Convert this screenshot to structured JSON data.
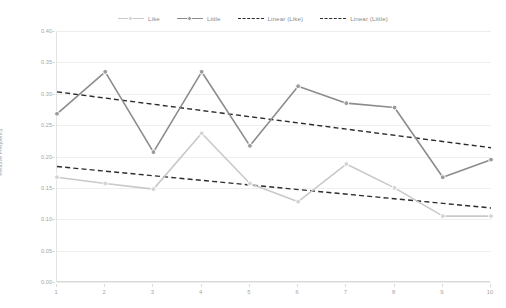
{
  "legend": {
    "position": "top-center",
    "items": [
      {
        "label": "Like",
        "style": "line-marker",
        "color": "#c9c9c9"
      },
      {
        "label": "Little",
        "style": "line-marker",
        "color": "#8c8c8c"
      },
      {
        "label": "Linear (Like)",
        "style": "dashed",
        "color": "#2c2c2c"
      },
      {
        "label": "Linear (Little)",
        "style": "dashed",
        "color": "#2c2c2c"
      }
    ]
  },
  "axes": {
    "y": {
      "label": "Relative Frequency",
      "ticks": [
        "0.40",
        "0.35",
        "0.30",
        "0.25",
        "0.20",
        "0.15",
        "0.10",
        "0.05",
        "0.00"
      ],
      "min": 0.0,
      "max": 0.4
    },
    "x": {
      "label": "",
      "ticks": [
        "1",
        "2",
        "3",
        "4",
        "5",
        "6",
        "7",
        "8",
        "9",
        "10"
      ],
      "min": 1,
      "max": 10
    }
  },
  "chart_data": {
    "type": "line",
    "title": "",
    "subtitle": "",
    "xlabel": "",
    "ylabel": "Relative Frequency",
    "x": [
      1,
      2,
      3,
      4,
      5,
      6,
      7,
      8,
      9,
      10
    ],
    "categories": [
      "1",
      "2",
      "3",
      "4",
      "5",
      "6",
      "7",
      "8",
      "9",
      "10"
    ],
    "xlim": [
      1,
      10
    ],
    "ylim": [
      0.0,
      0.4
    ],
    "grid": true,
    "legend_position": "top-center",
    "series": [
      {
        "name": "Like",
        "kind": "line-marker",
        "color": "#c9c9c9",
        "values": [
          0.167,
          0.157,
          0.148,
          0.237,
          0.157,
          0.128,
          0.188,
          0.15,
          0.105,
          0.105
        ]
      },
      {
        "name": "Little",
        "kind": "line-marker",
        "color": "#8c8c8c",
        "values": [
          0.268,
          0.335,
          0.207,
          0.335,
          0.217,
          0.312,
          0.285,
          0.278,
          0.167,
          0.195
        ]
      },
      {
        "name": "Linear (Like)",
        "kind": "trendline-dashed",
        "color": "#2c2c2c",
        "endpoints": {
          "x1": 1,
          "y1": 0.184,
          "x2": 10,
          "y2": 0.118
        }
      },
      {
        "name": "Linear (Little)",
        "kind": "trendline-dashed",
        "color": "#2c2c2c",
        "endpoints": {
          "x1": 1,
          "y1": 0.303,
          "x2": 10,
          "y2": 0.214
        }
      }
    ]
  },
  "colors": {
    "series_like": "#c9c9c9",
    "series_little": "#8c8c8c",
    "trendline": "#2c2c2c",
    "gridline": "#efefef",
    "axis": "#d8d8d8",
    "tick_text": "#a5a5a5",
    "background": "#ffffff"
  }
}
